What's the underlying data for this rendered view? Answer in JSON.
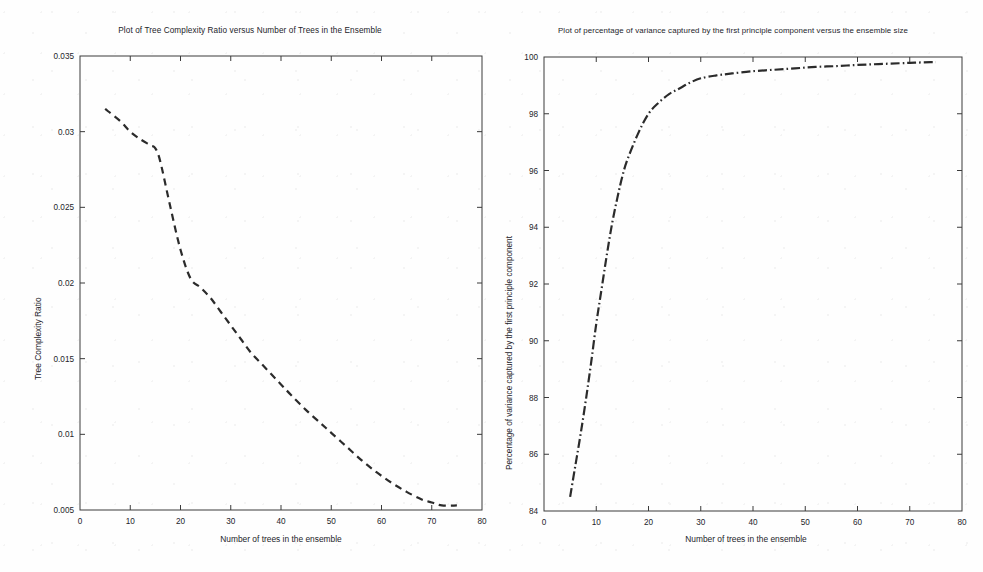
{
  "page": {
    "background_color": "#fefefe",
    "ink_color": "#2b2b2b"
  },
  "left": {
    "title": "Plot of Tree Complexity Ratio versus Number of Trees in the Ensemble",
    "xlabel": "Number of trees in the ensemble",
    "ylabel": "Tree Complexity Ratio",
    "xticks": [
      "0",
      "10",
      "20",
      "30",
      "40",
      "50",
      "60",
      "70",
      "80"
    ],
    "yticks": [
      "0.005",
      "0.01",
      "0.015",
      "0.02",
      "0.025",
      "0.03",
      "0.035"
    ]
  },
  "right": {
    "title": "Plot of percentage of variance captured by the first principle component versus the ensemble size",
    "xlabel": "Number of trees in the ensemble",
    "ylabel": "Percentage of variance captured by the first principle component",
    "xticks": [
      "0",
      "10",
      "20",
      "30",
      "40",
      "50",
      "60",
      "70",
      "80"
    ],
    "yticks": [
      "84",
      "86",
      "88",
      "90",
      "92",
      "94",
      "96",
      "98",
      "100"
    ]
  },
  "chart_data": [
    {
      "id": "tree-complexity-ratio",
      "type": "line",
      "title": "Plot of Tree Complexity Ratio versus Number of Trees in the Ensemble",
      "xlabel": "Number of trees in the ensemble",
      "ylabel": "Tree Complexity Ratio",
      "xlim": [
        0,
        80
      ],
      "ylim": [
        0.005,
        0.035
      ],
      "xticks": [
        0,
        10,
        20,
        30,
        40,
        50,
        60,
        70,
        80
      ],
      "yticks": [
        0.005,
        0.01,
        0.015,
        0.02,
        0.025,
        0.03,
        0.035
      ],
      "grid": false,
      "legend": false,
      "line_style": "dashed",
      "line_color": "#2b2b2b",
      "x": [
        5,
        8,
        10,
        12,
        14,
        15,
        16,
        18,
        20,
        22,
        24,
        26,
        28,
        30,
        32,
        34,
        36,
        38,
        40,
        42,
        45,
        48,
        50,
        53,
        56,
        59,
        62,
        65,
        68,
        70,
        72,
        75
      ],
      "y": [
        0.0315,
        0.0307,
        0.03,
        0.0295,
        0.0291,
        0.0289,
        0.028,
        0.025,
        0.0222,
        0.0203,
        0.0197,
        0.019,
        0.0181,
        0.0172,
        0.0163,
        0.0154,
        0.0147,
        0.014,
        0.0133,
        0.0126,
        0.0116,
        0.0107,
        0.0101,
        0.0092,
        0.0083,
        0.0075,
        0.0068,
        0.0062,
        0.0057,
        0.0055,
        0.0053,
        0.0053
      ]
    },
    {
      "id": "variance-captured-first-pc",
      "type": "line",
      "title": "Plot of percentage of variance captured by the first principle component versus the ensemble size",
      "xlabel": "Number of trees in the ensemble",
      "ylabel": "Percentage of variance captured by the first principle component",
      "xlim": [
        0,
        80
      ],
      "ylim": [
        84,
        100
      ],
      "xticks": [
        0,
        10,
        20,
        30,
        40,
        50,
        60,
        70,
        80
      ],
      "yticks": [
        84,
        86,
        88,
        90,
        92,
        94,
        96,
        98,
        100
      ],
      "grid": false,
      "legend": false,
      "line_style": "dash-dot",
      "line_color": "#2b2b2b",
      "x": [
        5,
        6,
        7,
        8,
        9,
        10,
        11,
        12,
        13,
        14,
        15,
        16,
        18,
        20,
        22,
        24,
        26,
        28,
        30,
        33,
        36,
        40,
        44,
        48,
        52,
        56,
        60,
        64,
        68,
        71,
        74,
        75
      ],
      "y": [
        84.5,
        85.6,
        86.7,
        87.9,
        89.2,
        90.6,
        91.8,
        93.0,
        94.1,
        95.0,
        95.8,
        96.4,
        97.3,
        98.0,
        98.4,
        98.7,
        98.9,
        99.1,
        99.25,
        99.35,
        99.42,
        99.5,
        99.55,
        99.6,
        99.65,
        99.68,
        99.72,
        99.75,
        99.78,
        99.8,
        99.82,
        99.82
      ]
    }
  ]
}
